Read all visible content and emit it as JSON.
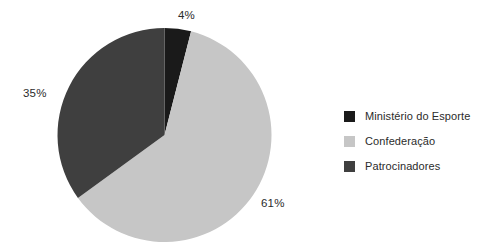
{
  "chart_data": {
    "type": "pie",
    "title": "",
    "categories": [
      "Ministério do Esporte",
      "Confederação",
      "Patrocinadores"
    ],
    "values": [
      4,
      61,
      35
    ],
    "value_labels": [
      "4%",
      "61%",
      "35%"
    ],
    "unit": "%",
    "colors": [
      "#1a1a1a",
      "#c6c6c6",
      "#3f3f3f"
    ],
    "legend_position": "right",
    "start_angle_deg": 0,
    "direction": "clockwise",
    "grid": false,
    "xlabel": "",
    "ylabel": "",
    "slices": [
      {
        "name": "Ministério do Esporte",
        "value": 4,
        "label": "4%",
        "color": "#1a1a1a",
        "start_deg": 0,
        "end_deg": 14.4
      },
      {
        "name": "Confederação",
        "value": 61,
        "label": "61%",
        "color": "#c6c6c6",
        "start_deg": 14.4,
        "end_deg": 234.0
      },
      {
        "name": "Patrocinadores",
        "value": 35,
        "label": "35%",
        "color": "#3f3f3f",
        "start_deg": 234.0,
        "end_deg": 360.0
      }
    ]
  },
  "labels": {
    "ministerio_pct": "4%",
    "confederacao_pct": "61%",
    "patrocinadores_pct": "35%"
  },
  "legend": {
    "items": [
      {
        "label": "Ministério do Esporte",
        "color": "#1a1a1a"
      },
      {
        "label": "Confederação",
        "color": "#c6c6c6"
      },
      {
        "label": "Patrocinadores",
        "color": "#3f3f3f"
      }
    ]
  }
}
